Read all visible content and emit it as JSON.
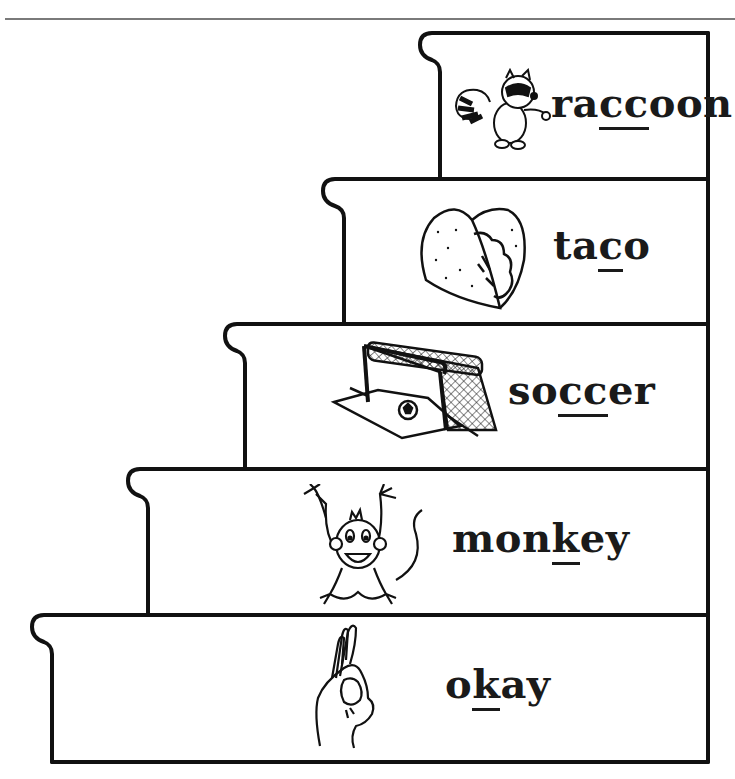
{
  "page": {
    "header_rule_color": "#7a7a7a",
    "line_color": "#111111"
  },
  "steps": [
    {
      "word": "raccoon",
      "parts": [
        "ra",
        "cc",
        "oon"
      ],
      "underlined": "cc",
      "picture": "raccoon-icon"
    },
    {
      "word": "taco",
      "parts": [
        "ta",
        "c",
        "o"
      ],
      "underlined": "c",
      "picture": "taco-icon"
    },
    {
      "word": "soccer",
      "parts": [
        "so",
        "cc",
        "er"
      ],
      "underlined": "cc",
      "picture": "soccer-goal-icon"
    },
    {
      "word": "monkey",
      "parts": [
        "mon",
        "k",
        "ey"
      ],
      "underlined": "k",
      "picture": "monkey-icon"
    },
    {
      "word": "okay",
      "parts": [
        "o",
        "k",
        "ay"
      ],
      "underlined": "k",
      "picture": "ok-hand-icon"
    }
  ]
}
